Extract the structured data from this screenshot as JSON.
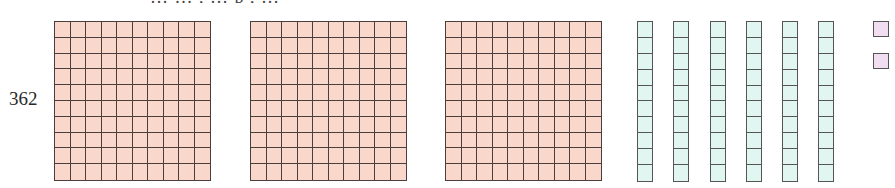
{
  "header": {
    "cropped_text": "… … , … p , …"
  },
  "number": {
    "label": "362",
    "hundreds": 3,
    "tens": 6,
    "ones": 2
  },
  "blocks": {
    "hundreds": [
      {
        "name": "hundred-block-1",
        "left": 54
      },
      {
        "name": "hundred-block-2",
        "left": 250
      },
      {
        "name": "hundred-block-3",
        "left": 445
      }
    ],
    "tens": [
      {
        "name": "ten-rod-1",
        "left": 637
      },
      {
        "name": "ten-rod-2",
        "left": 673
      },
      {
        "name": "ten-rod-3",
        "left": 710
      },
      {
        "name": "ten-rod-4",
        "left": 746
      },
      {
        "name": "ten-rod-5",
        "left": 782
      },
      {
        "name": "ten-rod-6",
        "left": 818
      }
    ],
    "ones": [
      {
        "name": "one-cube-1",
        "left": 873,
        "top": 21
      },
      {
        "name": "one-cube-2",
        "left": 873,
        "top": 53
      }
    ]
  },
  "colors": {
    "hundreds_fill": "#f9d7ca",
    "tens_fill": "#e1f5f1",
    "ones_fill": "#f1def1",
    "border": "#4a3f3c"
  }
}
